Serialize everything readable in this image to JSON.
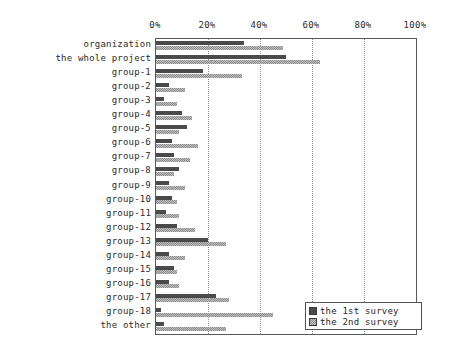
{
  "chart_data": {
    "type": "bar",
    "orientation": "horizontal",
    "title": "",
    "xlabel": "",
    "ylabel": "",
    "xlim": [
      0,
      100
    ],
    "xticks": [
      0,
      20,
      40,
      60,
      80,
      100
    ],
    "xtick_labels": [
      "0%",
      "20%",
      "40%",
      "60%",
      "80%",
      "100%"
    ],
    "grid": true,
    "grid_axis": "x",
    "legend_position": "bottom-right",
    "categories": [
      "organization",
      "the whole project",
      "group-1",
      "group-2",
      "group-3",
      "group-4",
      "group-5",
      "group-6",
      "group-7",
      "group-8",
      "group-9",
      "group-10",
      "group-11",
      "group-12",
      "group-13",
      "group-14",
      "group-15",
      "group-16",
      "group-17",
      "group-18",
      "the other"
    ],
    "series": [
      {
        "name": "the 1st survey",
        "color": "#4a4a4a",
        "values": [
          34,
          50,
          18,
          5,
          3,
          10,
          12,
          6,
          7,
          9,
          5,
          6,
          4,
          8,
          20,
          5,
          7,
          5,
          23,
          2,
          3
        ]
      },
      {
        "name": "the 2nd survey",
        "color": "#8c8c8c",
        "values": [
          49,
          63,
          33,
          11,
          8,
          14,
          9,
          16,
          13,
          7,
          11,
          8,
          9,
          15,
          27,
          11,
          8,
          9,
          28,
          45,
          27
        ]
      }
    ]
  },
  "legend": {
    "items": [
      {
        "label": "the 1st survey",
        "swatch": "s1"
      },
      {
        "label": "the 2nd survey",
        "swatch": "s2"
      }
    ]
  }
}
